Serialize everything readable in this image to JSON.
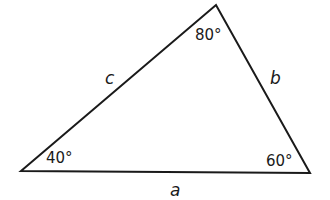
{
  "diagram": {
    "type": "triangle",
    "vertices": {
      "left": {
        "x": 21,
        "y": 171
      },
      "top": {
        "x": 216,
        "y": 5
      },
      "right": {
        "x": 310,
        "y": 173
      }
    },
    "angles": {
      "left": "40°",
      "top": "80°",
      "right": "60°"
    },
    "sides": {
      "a": "a",
      "b": "b",
      "c": "c"
    },
    "stroke_color": "#1a1a1a"
  }
}
